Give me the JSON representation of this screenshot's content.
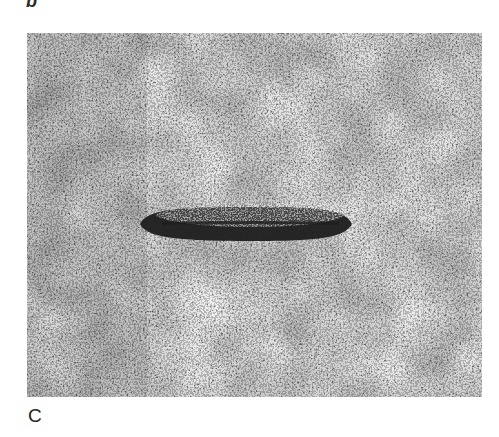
{
  "figure": {
    "top_label": "b",
    "panel_label": "C",
    "panel": {
      "description": "Negative-stain electron micrograph with grainy background and a single elongated dark-outlined rod-shaped particle in center",
      "background_color": "#8a8a8a",
      "particle_color": "#1e1e1e"
    }
  }
}
